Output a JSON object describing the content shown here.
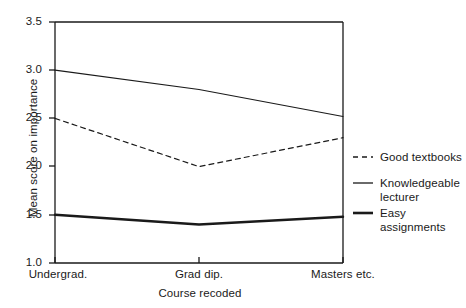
{
  "chart_data": {
    "type": "line",
    "title": "",
    "xlabel": "Course recoded",
    "ylabel": "Mean score on importance",
    "categories": [
      "Undergrad.",
      "Grad dip.",
      "Masters etc."
    ],
    "ylim": [
      1.0,
      3.5
    ],
    "yticks": [
      "1.0",
      "1.5",
      "2.0",
      "2.5",
      "3.0",
      "3.5"
    ],
    "ytick_values": [
      1.0,
      1.5,
      2.0,
      2.5,
      3.0,
      3.5
    ],
    "grid": false,
    "legend_position": "right",
    "series": [
      {
        "name": "Good textbooks",
        "values": [
          2.5,
          2.0,
          2.3
        ],
        "style": "dashed",
        "width": 1.2,
        "color": "#1a1a1a"
      },
      {
        "name": "Knowledgeable lecturer",
        "values": [
          3.0,
          2.8,
          2.52
        ],
        "style": "solid",
        "width": 1.2,
        "color": "#1a1a1a"
      },
      {
        "name": "Easy assignments",
        "values": [
          1.5,
          1.4,
          1.48
        ],
        "style": "solid",
        "width": 2.4,
        "color": "#1a1a1a"
      }
    ]
  },
  "axes": {
    "y_title": "Mean score on importance",
    "x_title": "Course recoded",
    "y_ticks": [
      "3.5",
      "3.0",
      "2.5",
      "2.0",
      "1.5",
      "1.0"
    ],
    "x_ticks": [
      "Undergrad.",
      "Grad dip.",
      "Masters etc."
    ]
  },
  "legend": {
    "entries": [
      {
        "label": "Good textbooks",
        "style": "dashed"
      },
      {
        "label": "Knowledgeable lecturer",
        "style": "solid-thin"
      },
      {
        "label": "Easy assignments",
        "style": "solid-thick"
      }
    ]
  },
  "colors": {
    "ink": "#1a1a1a",
    "background": "#ffffff"
  }
}
